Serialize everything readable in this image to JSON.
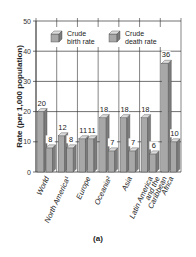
{
  "chart_data": {
    "type": "bar",
    "title": "",
    "xlabel": "",
    "ylabel": "Rate (per 1,000 population)",
    "ylim": [
      0,
      50
    ],
    "yticks": [
      0,
      10,
      20,
      30,
      40,
      50
    ],
    "grid": true,
    "legend_position": "top-inside",
    "categories": [
      "World",
      "North America¹",
      "Europe",
      "Oceania²",
      "Asia",
      "Latin America and the Caribbean",
      "Africa"
    ],
    "category_lines": [
      [
        "World"
      ],
      [
        "North America¹"
      ],
      [
        "Europe"
      ],
      [
        "Oceania²"
      ],
      [
        "Asia"
      ],
      [
        "Latin America",
        "and the",
        "Caribbean"
      ],
      [
        "Africa"
      ]
    ],
    "series": [
      {
        "name": "Crude birth rate",
        "values": [
          20,
          12,
          11,
          18,
          18,
          18,
          36
        ]
      },
      {
        "name": "Crude death rate",
        "values": [
          8,
          8,
          11,
          7,
          7,
          6,
          10
        ]
      }
    ],
    "caption": "(a)"
  },
  "legend": {
    "birth_line1": "Crude",
    "birth_line2": "birth rate",
    "death_line1": "Crude",
    "death_line2": "death rate"
  },
  "colors": {
    "bar_front": "#a8a8a8",
    "bar_side": "#7c7c7c",
    "bar_top": "#dcdcdc",
    "grid": "#333333"
  }
}
